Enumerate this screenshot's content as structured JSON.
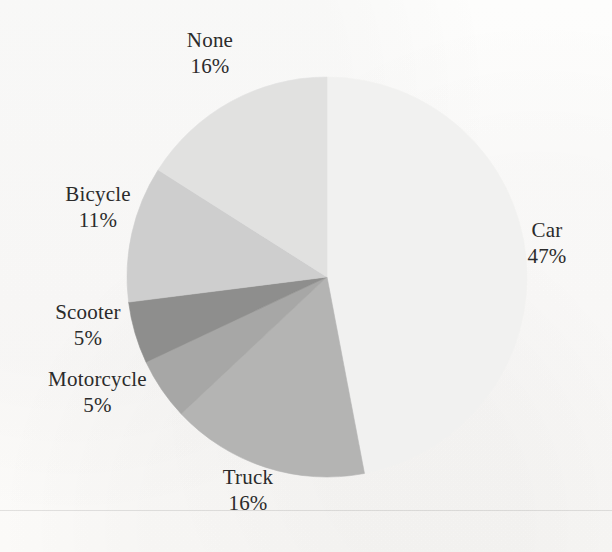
{
  "chart_data": {
    "type": "pie",
    "title": "",
    "subtitle": "",
    "xlabel": "",
    "ylabel": "",
    "legend_position": "none",
    "labels_position": "outside",
    "grid": false,
    "start_angle_deg": 90,
    "direction": "clockwise",
    "categories": [
      "Car",
      "Truck",
      "Motorcycle",
      "Scooter",
      "Bicycle",
      "None"
    ],
    "values": [
      47,
      16,
      5,
      5,
      11,
      16
    ],
    "value_suffix": "%",
    "slices": [
      {
        "label": "Car",
        "value": 47,
        "value_text": "47%",
        "color": "#f1f1f0"
      },
      {
        "label": "Truck",
        "value": 16,
        "value_text": "16%",
        "color": "#b4b4b3"
      },
      {
        "label": "Motorcycle",
        "value": 5,
        "value_text": "5%",
        "color": "#a7a7a6"
      },
      {
        "label": "Scooter",
        "value": 5,
        "value_text": "5%",
        "color": "#8e8e8d"
      },
      {
        "label": "Bicycle",
        "value": 11,
        "value_text": "11%",
        "color": "#cecece"
      },
      {
        "label": "None",
        "value": 16,
        "value_text": "16%",
        "color": "#e1e1e0"
      }
    ]
  },
  "labels": {
    "none": {
      "name": "None",
      "value": "16%"
    },
    "car": {
      "name": "Car",
      "value": "47%"
    },
    "bicycle": {
      "name": "Bicycle",
      "value": "11%"
    },
    "scooter": {
      "name": "Scooter",
      "value": "5%"
    },
    "motorcycle": {
      "name": "Motorcycle",
      "value": "5%"
    },
    "truck": {
      "name": "Truck",
      "value": "16%"
    }
  },
  "figure": {
    "background_color": "#fdfdfc",
    "text_color": "#2b2b2b",
    "center_x": 327,
    "center_y": 277,
    "radius": 200
  }
}
